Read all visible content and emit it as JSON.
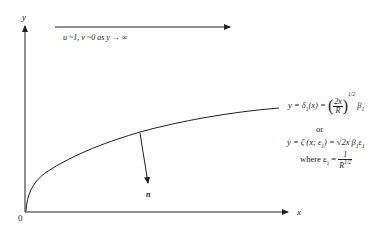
{
  "axes": {
    "y_label": "y",
    "x_label": "x",
    "origin_label": "0"
  },
  "freestream": {
    "condition": "u ~1,   v ~0  as  y → ∞"
  },
  "normal_vector": {
    "label": "n"
  },
  "equations": {
    "line1_lhs": "y = δ",
    "line1_sub": "1",
    "line1_mid": "(x) =",
    "line1_frac_num": "2x",
    "line1_frac_den": "R",
    "line1_exp": "1/2",
    "line1_rhs": "β",
    "line1_rhs_sub": "1",
    "or": "or",
    "line2": "y = ζ (x; ε",
    "line2_sub": "1",
    "line2_rest": ") = √2x β",
    "line2_b_sub": "1",
    "line2_end": "ε",
    "line2_end_sub": "1",
    "where": "where  ε",
    "where_sub": "1",
    "where_eq": " =",
    "where_num": "1",
    "where_den": "R",
    "where_den_exp": "1/2"
  },
  "colors": {
    "stroke": "#222222",
    "background": "#ffffff"
  }
}
